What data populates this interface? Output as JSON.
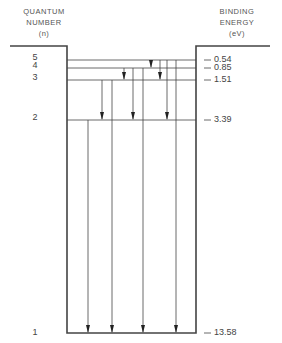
{
  "header": {
    "left": [
      "QUANTUM",
      "NUMBER",
      "(n)"
    ],
    "right": [
      "BINDING",
      "ENERGY",
      "(eV)"
    ]
  },
  "levels": [
    {
      "n": "5",
      "energy": "0.54",
      "y": 60
    },
    {
      "n": "4",
      "energy": "0.85",
      "y": 68
    },
    {
      "n": "3",
      "energy": "1.51",
      "y": 80
    },
    {
      "n": "2",
      "energy": "3.39",
      "y": 120
    },
    {
      "n": "1",
      "energy": "13.58",
      "y": 333
    }
  ],
  "transitions": [
    {
      "series": "Lyman",
      "from": 2,
      "to": 1,
      "x": 88
    },
    {
      "series": "Lyman",
      "from": 3,
      "to": 1,
      "x": 112
    },
    {
      "series": "Lyman",
      "from": 4,
      "to": 1,
      "x": 143
    },
    {
      "series": "Lyman",
      "from": 5,
      "to": 1,
      "x": 176
    },
    {
      "series": "Balmer",
      "from": 3,
      "to": 2,
      "x": 102
    },
    {
      "series": "Balmer",
      "from": 4,
      "to": 2,
      "x": 133
    },
    {
      "series": "Balmer",
      "from": 5,
      "to": 2,
      "x": 167
    },
    {
      "series": "Paschen",
      "from": 4,
      "to": 3,
      "x": 124
    },
    {
      "series": "Paschen",
      "from": 5,
      "to": 3,
      "x": 160
    },
    {
      "series": "Brackett",
      "from": 5,
      "to": 4,
      "x": 151
    }
  ],
  "well": {
    "left": 67,
    "right": 196,
    "top": 46,
    "outer_left": 10,
    "outer_right": 270
  },
  "colors": {
    "line": "#444444",
    "text": "#444444"
  }
}
